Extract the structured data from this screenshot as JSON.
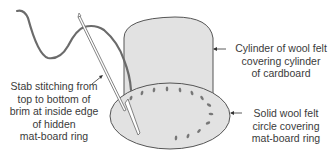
{
  "diagram": {
    "title": "",
    "colors": {
      "felt_fill": "#e2e2e2",
      "outline": "#555555",
      "thread": "#6b6b6b",
      "label_text": "#3a3a3a",
      "background": "#ffffff"
    },
    "labels": {
      "cylinder": {
        "lines": [
          "Cylinder of wool felt",
          "covering cylinder",
          "of cardboard"
        ]
      },
      "stab_stitching": {
        "lines": [
          "Stab stitching from",
          "top to bottom of",
          "brim at inside edge",
          "of hidden",
          "mat-board ring"
        ]
      },
      "circle": {
        "lines": [
          "Solid wool felt",
          "circle covering",
          "mat-board ring"
        ]
      }
    },
    "components": [
      "thread-icon",
      "needle-icon",
      "felt-cylinder",
      "felt-brim-circle",
      "stitch-marks"
    ]
  }
}
